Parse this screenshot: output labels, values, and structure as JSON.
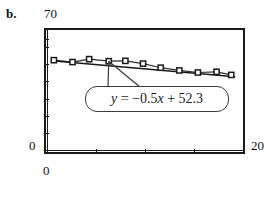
{
  "panel": {
    "letter": "b."
  },
  "chart_data": {
    "type": "scatter",
    "title": "",
    "xlabel": "",
    "ylabel": "",
    "xlim": [
      0,
      20
    ],
    "ylim": [
      0,
      70
    ],
    "x_tick_labels": [
      "0",
      "20"
    ],
    "y_tick_labels": [
      "0",
      "70"
    ],
    "grid": false,
    "legend": null,
    "marker_style": "open-square",
    "series": [
      {
        "name": "observations",
        "x": [
          0.7,
          2.6,
          4.3,
          6.3,
          8.0,
          9.8,
          11.6,
          13.5,
          15.4,
          17.3,
          18.8
        ],
        "y": [
          52.4,
          51.3,
          53.0,
          51.8,
          52.0,
          50.4,
          48.0,
          46.4,
          45.2,
          45.6,
          43.8
        ]
      }
    ],
    "trendline": {
      "type": "linear",
      "slope": -0.5,
      "intercept": 52.3,
      "equation": "y = −0.5x + 52.3",
      "x_start": 0.5,
      "x_end": 19.2
    },
    "annotation": {
      "text": "y = −0.5x + 52.3",
      "style": "rounded-callout-box",
      "pointer_target_x": 6.3,
      "pointer_target_y": 51.8
    },
    "axis_ticks": {
      "y_positions": [
        10,
        20,
        30,
        40,
        50,
        60,
        65
      ],
      "x_positions": [
        5,
        10,
        15,
        20
      ]
    }
  },
  "colors": {
    "axis": "#1a1a1a",
    "marker_edge": "#1a1a1a",
    "marker_fill": "#ffffff",
    "trendline": "#1a1a1a",
    "callout_border": "#3a3a3a",
    "text": "#111111",
    "background": "#ffffff"
  }
}
